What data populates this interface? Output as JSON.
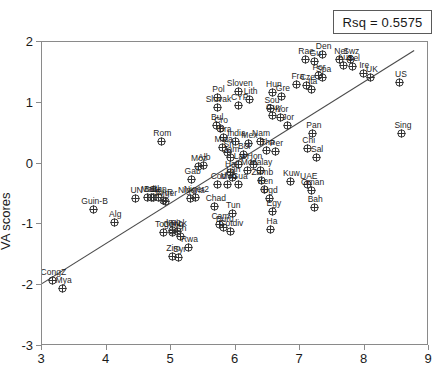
{
  "legend": {
    "rsq_text": "Rsq = 0.5575"
  },
  "axes": {
    "ylabel": "VA scores",
    "xlabel": "",
    "yticks": [
      2,
      1,
      0,
      -1,
      -2,
      -3
    ],
    "xticks": [
      3,
      4,
      5,
      6,
      7,
      8,
      9
    ]
  },
  "chart_data": {
    "type": "scatter",
    "title": "",
    "xlabel": "",
    "ylabel": "VA scores",
    "xlim": [
      3,
      9
    ],
    "ylim": [
      -3,
      2
    ],
    "grid": false,
    "legend_position": "top-right",
    "annotations": [
      "Rsq = 0.5575"
    ],
    "marker": "crossed-circle",
    "regression_line": {
      "x": [
        3.0,
        8.8
      ],
      "y": [
        -2.0,
        1.86
      ]
    },
    "points": [
      {
        "label": "CongZ",
        "x": 3.16,
        "y": -1.93
      },
      {
        "label": "Mya",
        "x": 3.32,
        "y": -2.06
      },
      {
        "label": "Guin-B",
        "x": 3.8,
        "y": -0.76
      },
      {
        "label": "Alg",
        "x": 4.12,
        "y": -0.97
      },
      {
        "label": "UN",
        "x": 4.45,
        "y": -0.57
      },
      {
        "label": "Mali",
        "x": 4.64,
        "y": -0.55
      },
      {
        "label": "Burk",
        "x": 4.7,
        "y": -0.55
      },
      {
        "label": "SL",
        "x": 4.73,
        "y": -0.56
      },
      {
        "label": "Ben",
        "x": 4.8,
        "y": -0.55
      },
      {
        "label": "Rom",
        "x": 4.85,
        "y": 0.37
      },
      {
        "label": "CAR",
        "x": 4.88,
        "y": -0.6
      },
      {
        "label": "Niger",
        "x": 4.92,
        "y": -0.62
      },
      {
        "label": "Togo",
        "x": 4.88,
        "y": -1.14
      },
      {
        "label": "Iraq",
        "x": 5.02,
        "y": -1.1
      },
      {
        "label": "Cong",
        "x": 5.02,
        "y": -1.14
      },
      {
        "label": "Nick",
        "x": 5.1,
        "y": -1.12
      },
      {
        "label": "Zim",
        "x": 5.02,
        "y": -1.52
      },
      {
        "label": "Syr",
        "x": 5.12,
        "y": -1.55
      },
      {
        "label": "Ch",
        "x": 5.14,
        "y": -1.2
      },
      {
        "label": "Rwa",
        "x": 5.27,
        "y": -1.38
      },
      {
        "label": "Gab",
        "x": 5.32,
        "y": -0.26
      },
      {
        "label": "Moz",
        "x": 5.42,
        "y": -0.05
      },
      {
        "label": "Alb",
        "x": 5.5,
        "y": -0.03
      },
      {
        "label": "Nigeria",
        "x": 5.3,
        "y": -0.58
      },
      {
        "label": "Niger2",
        "x": 5.38,
        "y": -0.55
      },
      {
        "label": "Slovak",
        "x": 5.72,
        "y": 0.92
      },
      {
        "label": "Pol",
        "x": 5.72,
        "y": 1.08
      },
      {
        "label": "CYP",
        "x": 6.05,
        "y": 0.95
      },
      {
        "label": "Sloven",
        "x": 6.05,
        "y": 1.18
      },
      {
        "label": "Lith",
        "x": 6.22,
        "y": 1.06
      },
      {
        "label": "Bul",
        "x": 5.7,
        "y": 0.62
      },
      {
        "label": "Cro",
        "x": 5.76,
        "y": 0.57
      },
      {
        "label": "Bra",
        "x": 5.82,
        "y": 0.43
      },
      {
        "label": "Mala",
        "x": 5.8,
        "y": 0.26
      },
      {
        "label": "Sri",
        "x": 5.88,
        "y": 0.18
      },
      {
        "label": "Jam",
        "x": 5.92,
        "y": 0.1
      },
      {
        "label": "India",
        "x": 6.0,
        "y": 0.37
      },
      {
        "label": "Bol",
        "x": 6.12,
        "y": 0.15
      },
      {
        "label": "Lat",
        "x": 6.05,
        "y": -0.01
      },
      {
        "label": "Hai",
        "x": 5.92,
        "y": -0.15
      },
      {
        "label": "Lan",
        "x": 5.95,
        "y": -0.23
      },
      {
        "label": "Cod",
        "x": 5.72,
        "y": -0.34
      },
      {
        "label": "Moo",
        "x": 5.88,
        "y": -0.35
      },
      {
        "label": "Gua",
        "x": 6.05,
        "y": -0.34
      },
      {
        "label": "Chad",
        "x": 5.68,
        "y": -0.7
      },
      {
        "label": "Cam",
        "x": 5.75,
        "y": -1.0
      },
      {
        "label": "Buru",
        "x": 5.82,
        "y": -1.05
      },
      {
        "label": "Cotdiv",
        "x": 5.92,
        "y": -1.12
      },
      {
        "label": "Tun",
        "x": 5.95,
        "y": -0.82
      },
      {
        "label": "Mor",
        "x": 6.18,
        "y": -0.12
      },
      {
        "label": "Hon",
        "x": 6.28,
        "y": -0.02
      },
      {
        "label": "Mex",
        "x": 6.2,
        "y": 0.33
      },
      {
        "label": "Nam",
        "x": 6.38,
        "y": 0.37
      },
      {
        "label": "Hun",
        "x": 6.58,
        "y": 1.17
      },
      {
        "label": "Gre",
        "x": 6.72,
        "y": 1.1
      },
      {
        "label": "Sou",
        "x": 6.55,
        "y": 0.9
      },
      {
        "label": "Guy",
        "x": 6.58,
        "y": 0.79
      },
      {
        "label": "Kor",
        "x": 6.7,
        "y": 0.76
      },
      {
        "label": "Jor",
        "x": 6.8,
        "y": 0.62
      },
      {
        "label": "Tha",
        "x": 6.48,
        "y": 0.22
      },
      {
        "label": "Per",
        "x": 6.62,
        "y": 0.2
      },
      {
        "label": "Malay",
        "x": 6.38,
        "y": -0.12
      },
      {
        "label": "Zamb",
        "x": 6.4,
        "y": -0.27
      },
      {
        "label": "Ken",
        "x": 6.45,
        "y": -0.43
      },
      {
        "label": "Ugd",
        "x": 6.52,
        "y": -0.57
      },
      {
        "label": "Egy",
        "x": 6.58,
        "y": -0.78
      },
      {
        "label": "Ha",
        "x": 6.55,
        "y": -1.08
      },
      {
        "label": "Kuw",
        "x": 6.85,
        "y": -0.3
      },
      {
        "label": "UAE",
        "x": 7.12,
        "y": -0.34
      },
      {
        "label": "Oman",
        "x": 7.18,
        "y": -0.44
      },
      {
        "label": "Bah",
        "x": 7.22,
        "y": -0.73
      },
      {
        "label": "Pan",
        "x": 7.2,
        "y": 0.5
      },
      {
        "label": "Chi",
        "x": 7.12,
        "y": 0.25
      },
      {
        "label": "Sal",
        "x": 7.25,
        "y": 0.1
      },
      {
        "label": "Fra",
        "x": 6.95,
        "y": 1.3
      },
      {
        "label": "Cze",
        "x": 7.1,
        "y": 1.28
      },
      {
        "label": "Ita",
        "x": 7.18,
        "y": 1.22
      },
      {
        "label": "Por",
        "x": 7.28,
        "y": 1.45
      },
      {
        "label": "Spa",
        "x": 7.35,
        "y": 1.42
      },
      {
        "label": "Gu",
        "x": 7.22,
        "y": 1.68
      },
      {
        "label": "Rae",
        "x": 7.08,
        "y": 1.72
      },
      {
        "label": "Den",
        "x": 7.35,
        "y": 1.8
      },
      {
        "label": "Net",
        "x": 7.62,
        "y": 1.72
      },
      {
        "label": "Swz",
        "x": 7.78,
        "y": 1.72
      },
      {
        "label": "Aus",
        "x": 7.68,
        "y": 1.62
      },
      {
        "label": "Bel",
        "x": 7.82,
        "y": 1.6
      },
      {
        "label": "Ire",
        "x": 7.98,
        "y": 1.48
      },
      {
        "label": "UK",
        "x": 8.1,
        "y": 1.42
      },
      {
        "label": "US",
        "x": 8.55,
        "y": 1.33
      },
      {
        "label": "Sing",
        "x": 8.58,
        "y": 0.49
      }
    ],
    "n_points_visible": 150,
    "note": "Dense overlapping country-code labelled scatter with OLS fit line"
  }
}
